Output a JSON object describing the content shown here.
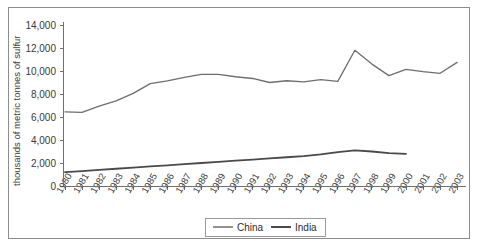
{
  "chart_data": {
    "type": "line",
    "title": "",
    "xlabel": "",
    "ylabel": "thousands of metric tonnes of sulfur",
    "ylim": [
      0,
      14000
    ],
    "ytick_values": [
      0,
      2000,
      4000,
      6000,
      8000,
      10000,
      12000,
      14000
    ],
    "ytick_labels": [
      "0",
      "2,000",
      "4,000",
      "6,000",
      "8,000",
      "10,000",
      "12,000",
      "14,000"
    ],
    "grid": false,
    "legend_position": "bottom-center",
    "categories": [
      "1980",
      "1981",
      "1982",
      "1983",
      "1984",
      "1985",
      "1986",
      "1987",
      "1988",
      "1989",
      "1990",
      "1991",
      "1992",
      "1993",
      "1994",
      "1995",
      "1996",
      "1997",
      "1998",
      "1999",
      "2000",
      "2001",
      "2002",
      "2003"
    ],
    "series": [
      {
        "name": "China",
        "color": "#6e6e6e",
        "width": 1.3,
        "values": [
          6450,
          6400,
          6950,
          7400,
          8050,
          8900,
          9150,
          9450,
          9700,
          9700,
          9500,
          9350,
          9000,
          9150,
          9050,
          9250,
          9100,
          11800,
          10600,
          9600,
          10150,
          9950,
          9800,
          10750
        ]
      },
      {
        "name": "India",
        "color": "#4a4a4a",
        "width": 1.8,
        "values": [
          1200,
          1300,
          1400,
          1500,
          1600,
          1700,
          1800,
          1900,
          2000,
          2100,
          2200,
          2300,
          2400,
          2500,
          2600,
          2750,
          2950,
          3100,
          3000,
          2850,
          2800,
          null,
          null,
          null
        ]
      }
    ]
  },
  "legend": {
    "entries": [
      {
        "label": "China"
      },
      {
        "label": "India"
      }
    ]
  },
  "axes": {
    "y_axis_title": "thousands of metric tonnes of sulfur"
  }
}
